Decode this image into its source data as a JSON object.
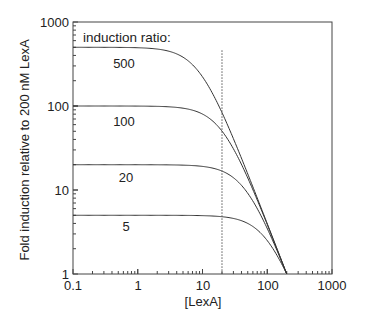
{
  "chart_data": {
    "type": "line",
    "title": "",
    "xlabel": "[LexA]",
    "ylabel": "Fold induction relative to 200 nM LexA",
    "xscale": "log",
    "yscale": "log",
    "xlim": [
      0.1,
      1000
    ],
    "ylim": [
      1,
      1000
    ],
    "x_ticks": [
      "0.1",
      "1",
      "10",
      "100",
      "1000"
    ],
    "y_ticks": [
      "1",
      "10",
      "100",
      "1000"
    ],
    "grid": false,
    "legend_title": "induction ratio:",
    "reference_line": {
      "x": 20,
      "style": "dotted",
      "y_top": 460
    },
    "x": [
      0.1,
      1,
      5,
      10,
      20,
      40,
      60,
      100,
      150,
      200
    ],
    "series": [
      {
        "name": "500",
        "values": [
          500,
          498,
          225,
          144,
          84,
          23,
          10.7,
          3.98,
          1.77,
          1.0
        ]
      },
      {
        "name": "100",
        "values": [
          100,
          100,
          80,
          62,
          50,
          20,
          10.1,
          3.88,
          1.76,
          1.0
        ]
      },
      {
        "name": "20",
        "values": [
          20,
          20,
          19.5,
          18.1,
          16.8,
          11.0,
          7.3,
          3.48,
          1.7,
          1.0
        ]
      },
      {
        "name": "5",
        "values": [
          5,
          5,
          5,
          4.8,
          4.8,
          4.3,
          3.7,
          2.5,
          1.53,
          1.0
        ]
      }
    ],
    "legend_position": "inside top-left"
  },
  "labels": {
    "legend_title": "induction ratio:",
    "x_axis": "[LexA]",
    "y_axis": "Fold induction relative to 200 nM LexA",
    "x_ticks": [
      "0.1",
      "1",
      "10",
      "100",
      "1000"
    ],
    "y_ticks": [
      "1",
      "10",
      "100",
      "1000"
    ],
    "series": [
      "500",
      "100",
      "20",
      "5"
    ]
  }
}
